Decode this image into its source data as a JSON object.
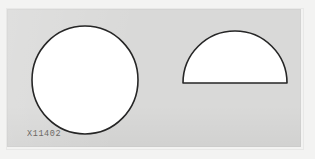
{
  "scene": {
    "background_color": "#f3f3f2",
    "card_color": "#d9d9d8",
    "outline_color": "#262626",
    "fill_color": "#ffffff"
  },
  "card": {
    "label": "X11402"
  },
  "shapes": [
    {
      "name": "circle",
      "label": "circle",
      "fill": "#ffffff",
      "stroke": "#262626"
    },
    {
      "name": "semicircle",
      "label": "semicircle",
      "fill": "#ffffff",
      "stroke": "#262626"
    }
  ]
}
